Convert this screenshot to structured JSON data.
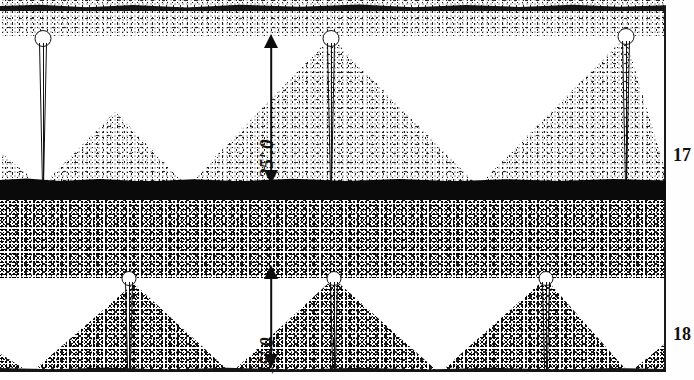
{
  "figure": {
    "type": "engineering-cross-section"
  },
  "dimensions": [
    {
      "id": "upper",
      "label": "25'.0",
      "value": 25.0,
      "unit": "ft",
      "stratum": "17"
    },
    {
      "id": "lower",
      "label": "15'.0",
      "value": 15.0,
      "unit": "ft",
      "stratum": "18"
    }
  ],
  "figure_labels": [
    {
      "id": "fig-17",
      "text": "17"
    },
    {
      "id": "fig-18",
      "text": "18"
    }
  ],
  "strata": {
    "upper_fill": {
      "name": "upper-soil-stipple",
      "tone": "#ffffff",
      "dot": "#111111"
    },
    "hardpan_band": {
      "name": "dense-hardpan-layer",
      "color": "#0a0a0a"
    },
    "lower_fill": {
      "name": "lower-soil-stipple",
      "tone": "#ffffff",
      "dot": "#000000"
    }
  },
  "colors": {
    "ink": "#111111",
    "paper": "#ffffff",
    "dark_band": "#0a0a0a"
  },
  "piles": {
    "upper": [
      {
        "x": 42
      },
      {
        "x": 330
      },
      {
        "x": 625
      }
    ],
    "lower": [
      {
        "x": 128
      },
      {
        "x": 333
      },
      {
        "x": 545
      }
    ]
  }
}
